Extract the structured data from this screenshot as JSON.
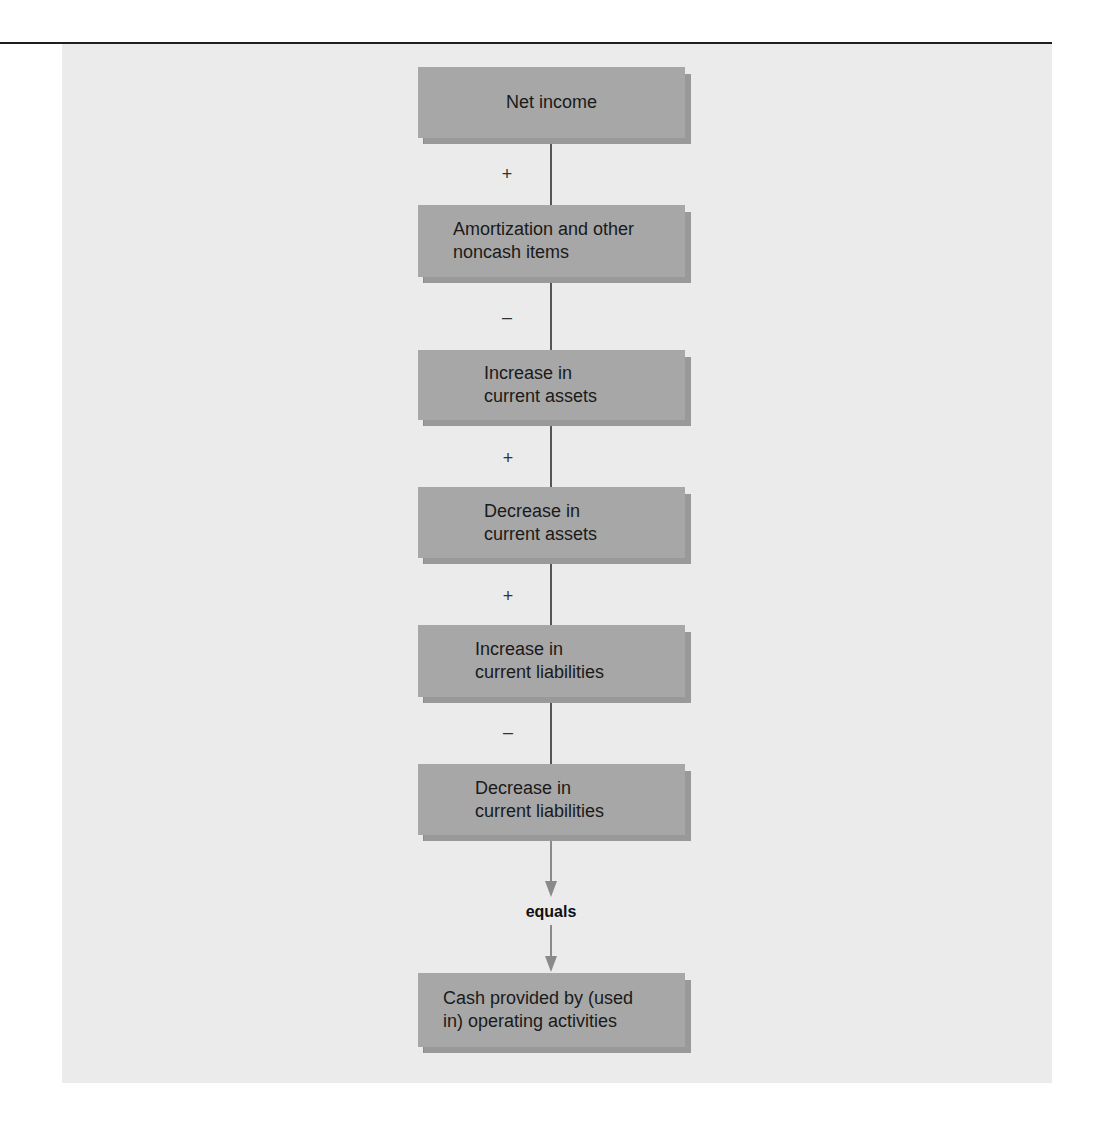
{
  "diagram": {
    "nodes": [
      {
        "id": "net-income",
        "label": "Net income",
        "align": "center"
      },
      {
        "id": "amortization",
        "label": "Amortization and other\nnoncash items",
        "align": "left"
      },
      {
        "id": "increase-current-assets",
        "label": "Increase in\ncurrent assets",
        "align": "left"
      },
      {
        "id": "decrease-current-assets",
        "label": "Decrease in\ncurrent assets",
        "align": "left"
      },
      {
        "id": "increase-current-liabilities",
        "label": "Increase in\ncurrent liabilities",
        "align": "left"
      },
      {
        "id": "decrease-current-liabilities",
        "label": "Decrease in\ncurrent liabilities",
        "align": "left"
      },
      {
        "id": "cash-operating",
        "label": "Cash provided by (used\nin) operating activities",
        "align": "left"
      }
    ],
    "operators": [
      {
        "between": [
          "net-income",
          "amortization"
        ],
        "symbol": "+"
      },
      {
        "between": [
          "amortization",
          "increase-current-assets"
        ],
        "symbol": "–"
      },
      {
        "between": [
          "increase-current-assets",
          "decrease-current-assets"
        ],
        "symbol": "+"
      },
      {
        "between": [
          "decrease-current-assets",
          "increase-current-liabilities"
        ],
        "symbol": "+"
      },
      {
        "between": [
          "increase-current-liabilities",
          "decrease-current-liabilities"
        ],
        "symbol": "–"
      }
    ],
    "result_label": "equals"
  },
  "colors": {
    "panel_background": "#ebebeb",
    "box_fill": "#a7a7a7",
    "box_shadow": "#999999",
    "connector": "#555555",
    "arrow": "#8a8a8a",
    "text": "#1a1a1a",
    "rule": "#1e1e1e"
  }
}
